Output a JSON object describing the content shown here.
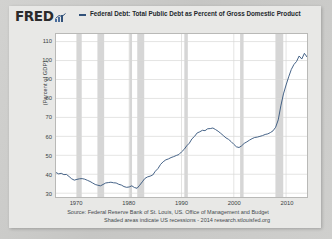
{
  "brand": {
    "wordmark": "FRED",
    "glyph_name": "fred-bar-chart-glyph",
    "accent_color": "#32527a"
  },
  "legend": {
    "label": "Federal Debt: Total Public Debt as Percent of Gross Domestic Product",
    "line_color": "#32527a"
  },
  "source": {
    "line1": "Source: Federal Reserve Bank of St. Louis, US. Office of Management and Budget",
    "line2": "Shaded areas indicate US recessions - 2014 research.stlouisfed.org"
  },
  "chart_data": {
    "type": "line",
    "title": "Federal Debt: Total Public Debt as Percent of Gross Domestic Product",
    "xlabel": "",
    "ylabel": "(Percent of GDP)",
    "xlim": [
      1966,
      2014
    ],
    "ylim": [
      28,
      114
    ],
    "ytick_values": [
      110,
      100,
      90,
      80,
      70,
      60,
      50,
      40,
      30
    ],
    "xtick_values": [
      1970,
      1980,
      1990,
      2000,
      2010
    ],
    "grid": true,
    "legend_position": "top",
    "line_color": "#32527a",
    "recession_color": "#d6d6d6",
    "recessions": [
      [
        1969.95,
        1970.92
      ],
      [
        1973.92,
        1975.21
      ],
      [
        1980.04,
        1980.54
      ],
      [
        1981.54,
        1982.87
      ],
      [
        1990.54,
        1991.21
      ],
      [
        2001.21,
        2001.87
      ],
      [
        2007.96,
        2009.46
      ]
    ],
    "x": [
      1966.0,
      1966.5,
      1967.0,
      1967.5,
      1968.0,
      1968.5,
      1969.0,
      1969.5,
      1970.0,
      1970.5,
      1971.0,
      1971.5,
      1972.0,
      1972.5,
      1973.0,
      1973.5,
      1974.0,
      1974.5,
      1975.0,
      1975.5,
      1976.0,
      1976.5,
      1977.0,
      1977.5,
      1978.0,
      1978.5,
      1979.0,
      1979.5,
      1980.0,
      1980.5,
      1981.0,
      1981.5,
      1982.0,
      1982.5,
      1983.0,
      1983.5,
      1984.0,
      1984.5,
      1985.0,
      1985.5,
      1986.0,
      1986.5,
      1987.0,
      1987.5,
      1988.0,
      1988.5,
      1989.0,
      1989.5,
      1990.0,
      1990.5,
      1991.0,
      1991.5,
      1992.0,
      1992.5,
      1993.0,
      1993.5,
      1994.0,
      1994.5,
      1995.0,
      1995.5,
      1996.0,
      1996.5,
      1997.0,
      1997.5,
      1998.0,
      1998.5,
      1999.0,
      1999.5,
      2000.0,
      2000.5,
      2001.0,
      2001.5,
      2002.0,
      2002.5,
      2003.0,
      2003.5,
      2004.0,
      2004.5,
      2005.0,
      2005.5,
      2006.0,
      2006.5,
      2007.0,
      2007.5,
      2008.0,
      2008.5,
      2009.0,
      2009.5,
      2010.0,
      2010.5,
      2011.0,
      2011.5,
      2012.0,
      2012.5,
      2013.0,
      2013.5,
      2014.0,
      2014.3
    ],
    "values": [
      40.9,
      40.2,
      40.5,
      39.8,
      39.9,
      38.8,
      37.6,
      36.9,
      37.3,
      37.6,
      37.7,
      37.4,
      36.8,
      36.2,
      35.4,
      34.6,
      34.2,
      33.9,
      34.6,
      35.4,
      35.6,
      35.8,
      35.5,
      35.4,
      34.7,
      34.3,
      33.5,
      33.1,
      33.3,
      33.9,
      33.0,
      32.6,
      34.2,
      36.0,
      37.8,
      38.6,
      39.0,
      39.6,
      41.6,
      43.0,
      45.2,
      46.6,
      47.6,
      48.1,
      48.8,
      49.3,
      49.9,
      50.4,
      51.8,
      53.1,
      55.0,
      56.4,
      58.7,
      60.0,
      61.8,
      62.4,
      63.2,
      63.0,
      64.0,
      64.1,
      64.4,
      63.6,
      62.7,
      61.6,
      60.4,
      59.2,
      58.4,
      57.2,
      55.8,
      54.5,
      54.1,
      55.0,
      56.3,
      57.1,
      58.0,
      58.8,
      59.4,
      59.6,
      60.0,
      60.4,
      61.0,
      61.3,
      62.0,
      62.9,
      64.8,
      68.7,
      76.1,
      82.4,
      87.1,
      91.4,
      95.3,
      97.9,
      99.5,
      102.4,
      100.8,
      103.8,
      101.9,
      104.5
    ]
  },
  "frame": {
    "card_bg": "#e8e8e6",
    "plot_bg": "#ffffff",
    "grid_color": "#d8d8d6"
  }
}
